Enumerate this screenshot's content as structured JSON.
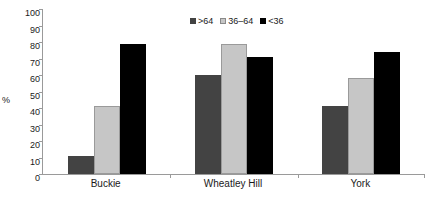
{
  "chart_data": {
    "type": "bar",
    "title": "",
    "xlabel": "",
    "ylabel": "%",
    "ylim": [
      0,
      100
    ],
    "yticks": [
      0,
      10,
      20,
      30,
      40,
      50,
      60,
      70,
      80,
      90,
      100
    ],
    "grid": false,
    "legend_position": "top-center",
    "categories": [
      "Buckie",
      "Wheatley Hill",
      "York"
    ],
    "series": [
      {
        "name": ">64",
        "color": "#434343",
        "values": [
          11,
          60,
          41
        ]
      },
      {
        "name": "36–64",
        "color": "#c6c6c6",
        "values": [
          41,
          79,
          58
        ]
      },
      {
        "name": "<36",
        "color": "#000000",
        "values": [
          79,
          71,
          74
        ]
      }
    ]
  },
  "axis": {
    "y_label": "%",
    "y_ticks": [
      "100",
      "90",
      "80",
      "70",
      "60",
      "50",
      "40",
      "30",
      "20",
      "10",
      "0"
    ]
  },
  "legend": {
    "items": [
      {
        "label": ">64"
      },
      {
        "label": "36–64"
      },
      {
        "label": "<36"
      }
    ]
  },
  "x_categories": [
    {
      "label": "Buckie"
    },
    {
      "label": "Wheatley Hill"
    },
    {
      "label": "York"
    }
  ]
}
